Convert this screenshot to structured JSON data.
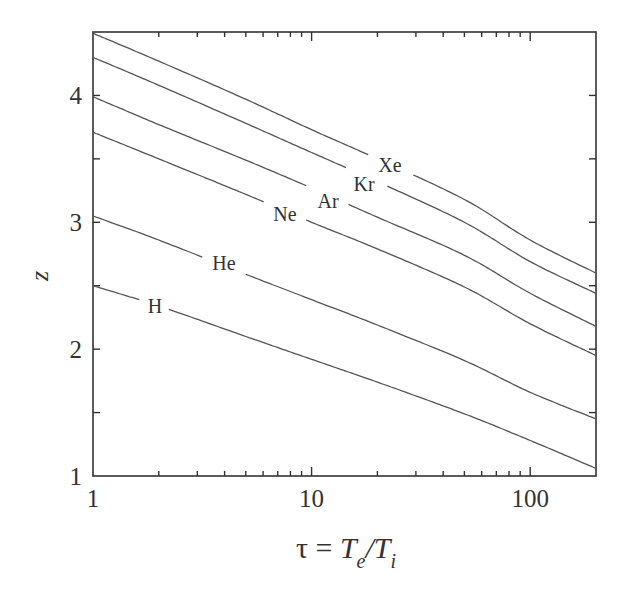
{
  "chart_data": {
    "type": "line",
    "title": "",
    "xlabel": "τ = Te/Ti",
    "xlabel_parts": {
      "prefix": "τ = ",
      "num": "T",
      "num_sub": "e",
      "slash": "/",
      "den": "T",
      "den_sub": "i"
    },
    "ylabel": "z",
    "xscale": "log",
    "xlim": [
      1,
      200
    ],
    "ylim": [
      1,
      4.5
    ],
    "grid": false,
    "legend": "inline labels",
    "x_ticks": [
      1,
      10,
      100
    ],
    "x_tick_labels": [
      "1",
      "10",
      "100"
    ],
    "y_ticks": [
      1,
      2,
      3,
      4
    ],
    "y_tick_labels": [
      "1",
      "2",
      "3",
      "4"
    ],
    "y_minor_ticks": [
      1.5,
      2.5,
      3.5
    ],
    "x": [
      1,
      2,
      5,
      10,
      20,
      50,
      100,
      200
    ],
    "series": [
      {
        "name": "Xe",
        "values": [
          4.49,
          4.27,
          3.97,
          3.73,
          3.5,
          3.18,
          2.86,
          2.6
        ],
        "label_pos": [
          390,
          165
        ]
      },
      {
        "name": "Kr",
        "values": [
          4.3,
          4.08,
          3.78,
          3.55,
          3.32,
          3.0,
          2.69,
          2.44
        ],
        "label_pos": [
          364,
          184
        ]
      },
      {
        "name": "Ar",
        "values": [
          3.99,
          3.77,
          3.49,
          3.27,
          3.04,
          2.74,
          2.44,
          2.18
        ],
        "label_pos": [
          328,
          201
        ]
      },
      {
        "name": "Ne",
        "values": [
          3.71,
          3.5,
          3.22,
          3.0,
          2.79,
          2.49,
          2.2,
          1.95
        ],
        "label_pos": [
          285,
          214
        ]
      },
      {
        "name": "He",
        "values": [
          3.05,
          2.86,
          2.59,
          2.39,
          2.19,
          1.91,
          1.66,
          1.45
        ],
        "label_pos": [
          224,
          263
        ]
      },
      {
        "name": "H",
        "values": [
          2.5,
          2.34,
          2.1,
          1.92,
          1.74,
          1.49,
          1.28,
          1.06
        ],
        "label_pos": [
          155,
          306
        ]
      }
    ],
    "colors": {
      "line": "#555555",
      "axis": "#333333",
      "text": "#333333"
    }
  }
}
